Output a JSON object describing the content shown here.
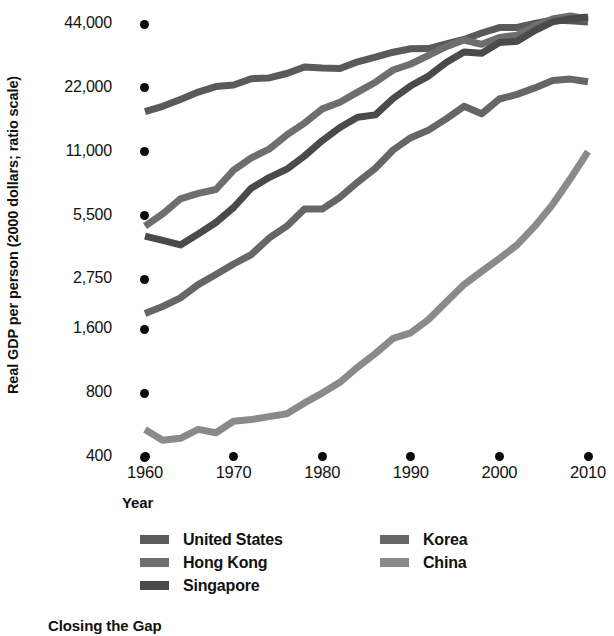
{
  "chart_data": {
    "type": "line",
    "title": "Closing the Gap",
    "xlabel": "Year",
    "ylabel": "Real GDP per person (2000 dollars; ratio scale)",
    "grid": false,
    "legend_position": "bottom",
    "yscale": "log",
    "xlim": [
      1960,
      2010
    ],
    "ylim": [
      400,
      48000
    ],
    "ytick_labels": [
      "44,000",
      "22,000",
      "11,000",
      "5,500",
      "2,750",
      "1,600",
      "800",
      "400"
    ],
    "ytick_values": [
      44000,
      22000,
      11000,
      5500,
      2750,
      1600,
      800,
      400
    ],
    "xtick_labels": [
      "1960",
      "1970",
      "1980",
      "1990",
      "2000",
      "2010"
    ],
    "xtick_values": [
      1960,
      1970,
      1980,
      1990,
      2000,
      2010
    ],
    "x": [
      1960,
      1962,
      1964,
      1966,
      1968,
      1970,
      1972,
      1974,
      1976,
      1978,
      1980,
      1982,
      1984,
      1986,
      1988,
      1990,
      1992,
      1994,
      1996,
      1998,
      2000,
      2002,
      2004,
      2006,
      2008,
      2010
    ],
    "series": [
      {
        "name": "United States",
        "color": "#5a5a5a",
        "values": [
          17000,
          18000,
          19400,
          21000,
          22300,
          22700,
          24300,
          24500,
          25700,
          27600,
          27300,
          27100,
          29200,
          30700,
          32400,
          33600,
          33700,
          35400,
          37200,
          39900,
          42300,
          42400,
          44300,
          46000,
          45600,
          44900
        ]
      },
      {
        "name": "Hong Kong",
        "color": "#6e6e6e",
        "values": [
          4900,
          5600,
          6600,
          7000,
          7300,
          9000,
          10300,
          11300,
          13200,
          15000,
          17500,
          18800,
          21000,
          23400,
          26700,
          28500,
          31300,
          34400,
          37000,
          35300,
          38000,
          39000,
          43000,
          46500,
          48000,
          46500
        ]
      },
      {
        "name": "Singapore",
        "color": "#4a4a4a",
        "values": [
          4400,
          4200,
          4000,
          4500,
          5100,
          6000,
          7400,
          8300,
          9100,
          10500,
          12400,
          14300,
          16000,
          16400,
          19600,
          22500,
          25000,
          29000,
          32500,
          32000,
          36000,
          36500,
          41000,
          45000,
          46500,
          47500
        ]
      },
      {
        "name": "Korea",
        "color": "#666666",
        "values": [
          1900,
          2050,
          2250,
          2600,
          2900,
          3250,
          3600,
          4300,
          4900,
          5900,
          5900,
          6700,
          7900,
          9200,
          11200,
          12800,
          13900,
          15700,
          18000,
          16600,
          19500,
          20500,
          22000,
          23800,
          24200,
          23500
        ]
      },
      {
        "name": "China",
        "color": "#8a8a8a",
        "values": [
          540,
          480,
          490,
          540,
          520,
          590,
          600,
          620,
          640,
          720,
          800,
          900,
          1060,
          1230,
          1450,
          1540,
          1780,
          2150,
          2600,
          3000,
          3450,
          4000,
          4900,
          6200,
          8200,
          11000
        ]
      }
    ]
  },
  "legend": {
    "left_column": [
      {
        "label": "United States",
        "color": "#5a5a5a"
      },
      {
        "label": "Hong Kong",
        "color": "#6e6e6e"
      },
      {
        "label": "Singapore",
        "color": "#4a4a4a"
      }
    ],
    "right_column": [
      {
        "label": "Korea",
        "color": "#666666"
      },
      {
        "label": "China",
        "color": "#8a8a8a"
      }
    ]
  }
}
